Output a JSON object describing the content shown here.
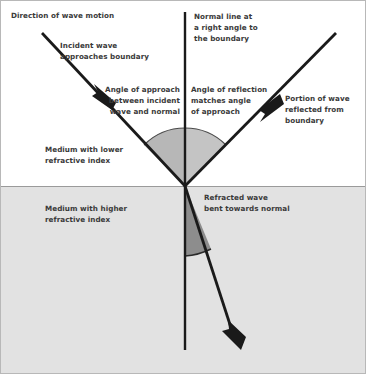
{
  "diagram": {
    "canvas": {
      "width": 366,
      "height": 374
    },
    "colors": {
      "background": "#ffffff",
      "upper_medium_fill": "#ffffff",
      "lower_medium_fill": "#e2e2e2",
      "boundary_line": "#9a9a9a",
      "ray_stroke": "#1a1a1a",
      "normal_stroke": "#1a1a1a",
      "angle_wedge_upper": "#b5b5b5",
      "angle_wedge_lower": "#8d8d8d",
      "text": "#3a3a3a",
      "border": "#b8b8b8"
    },
    "geometry": {
      "vertex": {
        "x": 185,
        "y": 186
      },
      "boundary_y": 186,
      "normal_top": {
        "x": 185,
        "y": 12
      },
      "normal_bottom": {
        "x": 185,
        "y": 350
      },
      "incident_start": {
        "x": 42,
        "y": 33
      },
      "incident_arrow_at": {
        "x": 108,
        "y": 106
      },
      "reflected_end": {
        "x": 336,
        "y": 33
      },
      "reflected_arrow_at": {
        "x": 274,
        "y": 100
      },
      "refracted_end": {
        "x": 239,
        "y": 346
      },
      "angle_of_approach_deg": 45,
      "angle_of_reflection_deg": 45,
      "angle_of_refraction_deg": 22
    }
  },
  "labels": {
    "direction_of_motion": "Direction of wave motion",
    "incident_wave": "Incident wave\napproaches boundary",
    "normal_line": "Normal line at\na right angle to\nthe boundary",
    "angle_of_approach": "Angle of approach\nbetween incident\nwave and normal",
    "angle_of_reflection": "Angle of reflection\nmatches angle\nof approach",
    "portion_reflected": "Portion of wave\nreflected from\nboundary",
    "medium_lower": "Medium with lower\nrefractive index",
    "medium_higher": "Medium with higher\nrefractive index",
    "refracted_wave": "Refracted wave\nbent towards normal"
  }
}
